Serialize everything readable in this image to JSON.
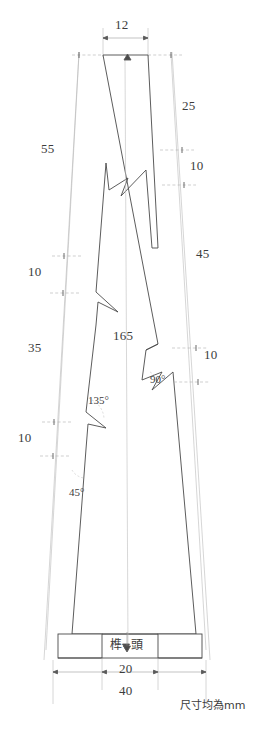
{
  "drawing": {
    "title": "Tenon Component Dimensioned Drawing",
    "part_label": {
      "text_left": "榫",
      "text_right": "頭",
      "full": "榫頭"
    },
    "note": "尺寸均為smm",
    "units_note": "尺寸均為mm",
    "colors": {
      "outline": "#4a4a4a",
      "dimension": "#9a9a9a",
      "text": "#3c3c3c",
      "background": "#ffffff"
    },
    "dimensions": {
      "top_width": "12",
      "left_55": "55",
      "left_10_upper": "10",
      "left_35": "35",
      "left_10_lower": "10",
      "right_25": "25",
      "right_10_upper": "10",
      "right_45": "45",
      "right_10_lower": "10",
      "center_height": "165",
      "bottom_inner": "20",
      "bottom_outer": "40"
    },
    "angles": {
      "angle_135": "135°",
      "angle_45": "45°",
      "angle_90": "90°"
    }
  }
}
